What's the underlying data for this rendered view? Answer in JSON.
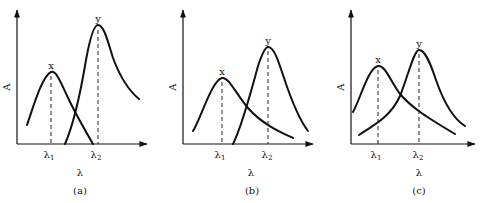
{
  "panels": [
    {
      "id": "a",
      "caption": "(a)",
      "y_axis_label": "A",
      "x_axis_label": "λ",
      "peaks": [
        {
          "name": "x",
          "label": "x",
          "tick_label": "λ",
          "tick_sub": "1"
        },
        {
          "name": "y",
          "label": "y",
          "tick_label": "λ",
          "tick_sub": "2"
        }
      ],
      "description": "Peaks x and y well separated; x at λ1 does not overlap y at λ2 significantly"
    },
    {
      "id": "b",
      "caption": "(b)",
      "y_axis_label": "A",
      "x_axis_label": "λ",
      "peaks": [
        {
          "name": "x",
          "label": "x",
          "tick_label": "λ",
          "tick_sub": "1"
        },
        {
          "name": "y",
          "label": "y",
          "tick_label": "λ",
          "tick_sub": "2"
        }
      ],
      "description": "Peaks partially overlapping"
    },
    {
      "id": "c",
      "caption": "(c)",
      "y_axis_label": "A",
      "x_axis_label": "λ",
      "peaks": [
        {
          "name": "x",
          "label": "x",
          "tick_label": "λ",
          "tick_sub": "1"
        },
        {
          "name": "y",
          "label": "y",
          "tick_label": "λ",
          "tick_sub": "2"
        }
      ],
      "description": "Peaks strongly overlapping"
    }
  ],
  "colors": {
    "line": "#111111",
    "background": "#ffffff"
  }
}
